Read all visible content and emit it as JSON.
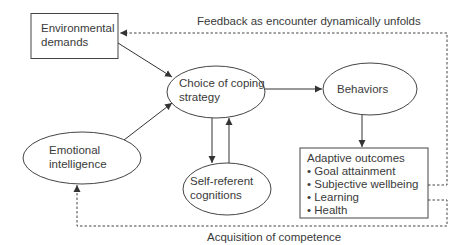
{
  "diagram": {
    "nodes": {
      "environmental_demands": {
        "line1": "Environmental",
        "line2": "demands",
        "shape": "rectangle"
      },
      "choice_of_coping": {
        "line1": "Choice of coping",
        "line2": "strategy",
        "shape": "ellipse"
      },
      "behaviors": {
        "label": "Behaviors",
        "shape": "ellipse"
      },
      "emotional_intelligence": {
        "line1": "Emotional",
        "line2": "intelligence",
        "shape": "ellipse"
      },
      "self_referent": {
        "line1": "Self-referent",
        "line2": "cognitions",
        "shape": "ellipse"
      },
      "adaptive_outcomes": {
        "title": "Adaptive outcomes",
        "items": [
          "• Goal attainment",
          "• Subjective wellbeing",
          "• Learning",
          "• Health"
        ],
        "shape": "rectangle"
      }
    },
    "edges": [
      {
        "from": "Environmental demands",
        "to": "Choice of coping strategy",
        "style": "solid"
      },
      {
        "from": "Emotional intelligence",
        "to": "Choice of coping strategy",
        "style": "solid"
      },
      {
        "from": "Choice of coping strategy",
        "to": "Behaviors",
        "style": "solid"
      },
      {
        "from": "Choice of coping strategy",
        "to": "Self-referent cognitions",
        "style": "solid"
      },
      {
        "from": "Self-referent cognitions",
        "to": "Choice of coping strategy",
        "style": "solid"
      },
      {
        "from": "Behaviors",
        "to": "Adaptive outcomes",
        "style": "solid"
      },
      {
        "from": "Adaptive outcomes",
        "to": "Environmental demands",
        "style": "dashed",
        "label": "Feedback as encounter dynamically unfolds"
      },
      {
        "from": "Adaptive outcomes",
        "to": "Emotional intelligence",
        "style": "dashed",
        "label": "Acquisition of competence"
      }
    ],
    "labels": {
      "feedback": "Feedback as encounter dynamically unfolds",
      "acquisition": "Acquisition of competence"
    },
    "colors": {
      "line": "#3a3a3a",
      "background": "#ffffff"
    }
  }
}
